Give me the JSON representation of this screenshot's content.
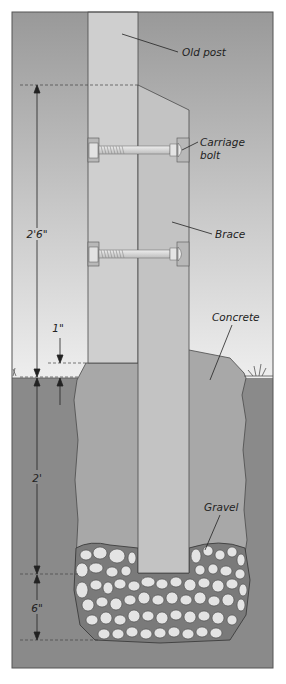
{
  "figure": {
    "labels": {
      "old_post": "Old post",
      "carriage_bolt_line1": "Carriage",
      "carriage_bolt_line2": "bolt",
      "brace": "Brace",
      "concrete": "Concrete",
      "gravel": "Gravel"
    },
    "dimensions": {
      "brace_above_ground": "2'6\"",
      "concrete_above_ground": "1\"",
      "hole_depth_concrete": "2'",
      "gravel_depth": "6\""
    },
    "colors": {
      "sky_top": "#9a9a9a",
      "sky_bottom": "#ececec",
      "soil": "#8c8c8c",
      "concrete": "#a9a9a9",
      "old_post": "#cfcfcf",
      "brace": "#c4c4c4",
      "gravel_stone": "#e6e6e6",
      "outline": "#4a4a4a"
    }
  }
}
